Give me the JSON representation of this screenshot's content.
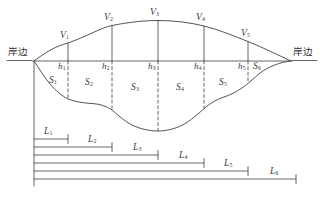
{
  "figure": {
    "kind": "river-cross-section-diagram",
    "bank_label_left": "岸边",
    "bank_label_right": "岸边",
    "colors": {
      "line": "#555555",
      "curve": "#4a4a4a",
      "text": "#3a3a3a",
      "background": "#ffffff"
    }
  },
  "velocity_points": [
    {
      "label": "V",
      "sub": "1",
      "x": 68,
      "y_top": 44,
      "y_surface": 61,
      "text_x": 60,
      "text_y": 33
    },
    {
      "label": "V",
      "sub": "2",
      "x": 112,
      "y_top": 26,
      "y_surface": 61,
      "text_x": 104,
      "text_y": 16
    },
    {
      "label": "V",
      "sub": "3",
      "x": 158,
      "y_top": 21,
      "y_surface": 61,
      "text_x": 150,
      "text_y": 11
    },
    {
      "label": "V",
      "sub": "4",
      "x": 204,
      "y_top": 26,
      "y_surface": 61,
      "text_x": 196,
      "text_y": 16
    },
    {
      "label": "V",
      "sub": "5",
      "x": 248,
      "y_top": 41,
      "y_surface": 61,
      "text_x": 241,
      "text_y": 31
    }
  ],
  "depth_labels": [
    {
      "label": "h",
      "sub": "1",
      "text_x": 58,
      "text_y": 64
    },
    {
      "label": "h",
      "sub": "2",
      "text_x": 102,
      "text_y": 64
    },
    {
      "label": "h",
      "sub": "3",
      "text_x": 148,
      "text_y": 64
    },
    {
      "label": "h",
      "sub": "4",
      "text_x": 194,
      "text_y": 64
    },
    {
      "label": "h",
      "sub": "5",
      "text_x": 238,
      "text_y": 64
    }
  ],
  "area_labels": [
    {
      "label": "S",
      "sub": "1",
      "text_x": 49,
      "text_y": 79
    },
    {
      "label": "S",
      "sub": "2",
      "text_x": 85,
      "text_y": 80
    },
    {
      "label": "S",
      "sub": "3",
      "text_x": 131,
      "text_y": 85
    },
    {
      "label": "S",
      "sub": "4",
      "text_x": 176,
      "text_y": 85
    },
    {
      "label": "S",
      "sub": "5",
      "text_x": 219,
      "text_y": 80
    },
    {
      "label": "S",
      "sub": "6",
      "text_x": 253,
      "text_y": 64
    }
  ],
  "distance_lines": [
    {
      "label": "L",
      "sub": "1",
      "y": 139,
      "x_start": 34,
      "x_end": 68,
      "text_x": 44,
      "text_y": 129
    },
    {
      "label": "L",
      "sub": "2",
      "y": 147,
      "x_start": 34,
      "x_end": 112,
      "text_x": 88,
      "text_y": 137
    },
    {
      "label": "L",
      "sub": "3",
      "y": 155,
      "x_start": 34,
      "x_end": 158,
      "text_x": 133,
      "text_y": 145
    },
    {
      "label": "L",
      "sub": "4",
      "y": 163,
      "x_start": 34,
      "x_end": 204,
      "text_x": 179,
      "text_y": 153
    },
    {
      "label": "L",
      "sub": "5",
      "y": 171,
      "x_start": 34,
      "x_end": 248,
      "text_x": 224,
      "text_y": 161
    },
    {
      "label": "L",
      "sub": "6",
      "y": 179,
      "x_start": 34,
      "x_end": 296,
      "text_x": 270,
      "text_y": 169
    }
  ],
  "bank_markers": {
    "left_text_x": 8,
    "left_text_y": 51,
    "right_text_x": 293,
    "right_text_y": 51
  },
  "geometry": {
    "surface_y": 61,
    "surface_x_left": 33,
    "surface_x_right": 292,
    "left_shore_x": 34,
    "right_shore_x": 291,
    "vertical_ref_bottom": 186
  }
}
